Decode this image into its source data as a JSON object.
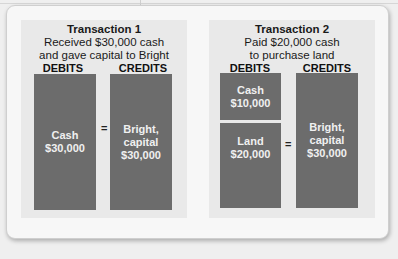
{
  "transactions": [
    {
      "title": "Transaction 1",
      "description_line1": "Received $30,000 cash",
      "description_line2": "and gave capital to Bright",
      "debits_label": "DEBITS",
      "credits_label": "CREDITS",
      "debits": [
        {
          "account": "Cash",
          "amount": "$30,000"
        }
      ],
      "credits": [
        {
          "account_line1": "Bright,",
          "account_line2": "capital",
          "amount": "$30,000"
        }
      ],
      "equals": "="
    },
    {
      "title": "Transaction 2",
      "description_line1": "Paid $20,000 cash",
      "description_line2": "to purchase land",
      "debits_label": "DEBITS",
      "credits_label": "CREDITS",
      "debits": [
        {
          "account": "Cash",
          "amount": "$10,000"
        },
        {
          "account": "Land",
          "amount": "$20,000"
        }
      ],
      "credits": [
        {
          "account_line1": "Bright,",
          "account_line2": "capital",
          "amount": "$30,000"
        }
      ],
      "equals": "="
    }
  ],
  "colors": {
    "box_fill": "#6c6c6c",
    "box_text": "#f0f0f0",
    "panel_bg": "#e9e9e9",
    "card_bg": "#f7f7f7"
  }
}
